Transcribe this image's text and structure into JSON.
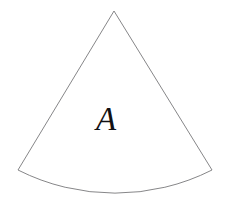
{
  "figure": {
    "kind": "geometry-diagram",
    "shape_name": "circular-sector",
    "background_color": "#ffffff",
    "stroke_color": "#78787a",
    "fill_color": "#ffffff",
    "stroke_width": 0.9,
    "width": 230,
    "height": 205
  },
  "label": {
    "text": "A",
    "color": "#111113",
    "style": "italic-serif",
    "font_size_px": 33,
    "x": 96,
    "y": 103
  },
  "geometry": {
    "apex": {
      "x": 114,
      "y": 11
    },
    "left_corner": {
      "x": 18,
      "y": 170
    },
    "right_corner": {
      "x": 212,
      "y": 170
    },
    "arc_lowest_point": {
      "x": 115,
      "y": 193
    },
    "arc_radius": 215,
    "arc_sweep_flag": 1,
    "arc_large_flag": 0,
    "path_d": "M 114 11 L 18 170 A 215 215 0 0 0 212 170 Z"
  }
}
